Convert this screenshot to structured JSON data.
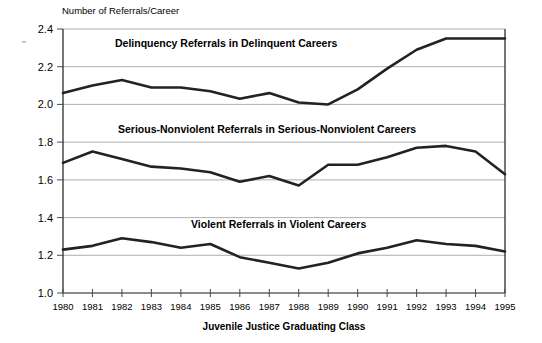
{
  "chart_data": {
    "type": "line",
    "title": "",
    "xlabel": "Juvenile Justice Graduating Class",
    "ylabel": "Number of Referrals/Career",
    "categories": [
      "1980",
      "1981",
      "1982",
      "1983",
      "1984",
      "1985",
      "1986",
      "1987",
      "1988",
      "1989",
      "1990",
      "1991",
      "1992",
      "1993",
      "1994",
      "1995"
    ],
    "x": [
      1980,
      1981,
      1982,
      1983,
      1984,
      1985,
      1986,
      1987,
      1988,
      1989,
      1990,
      1991,
      1992,
      1993,
      1994,
      1995
    ],
    "ylim": [
      1.0,
      2.4
    ],
    "yticks": [
      "1.0",
      "1.2",
      "1.4",
      "1.6",
      "1.8",
      "2.0",
      "2.2",
      "2.4"
    ],
    "ytick_values": [
      1.0,
      1.2,
      1.4,
      1.6,
      1.8,
      2.0,
      2.2,
      2.4
    ],
    "grid": true,
    "legend_position": "inline-labels",
    "series": [
      {
        "name": "Delinquency Referrals in Delinquent Careers",
        "label": "Delinquency Referrals in Delinquent Careers",
        "values": [
          2.06,
          2.1,
          2.13,
          2.09,
          2.09,
          2.07,
          2.03,
          2.06,
          2.01,
          2.0,
          2.08,
          2.19,
          2.29,
          2.35,
          2.35,
          2.35
        ]
      },
      {
        "name": "Serious-Nonviolent Referrals in Serious-Nonviolent Careers",
        "label": "Serious-Nonviolent Referrals in Serious-Nonviolent Careers",
        "values": [
          1.69,
          1.75,
          1.71,
          1.67,
          1.66,
          1.64,
          1.59,
          1.62,
          1.57,
          1.68,
          1.68,
          1.72,
          1.77,
          1.78,
          1.75,
          1.63
        ]
      },
      {
        "name": "Violent Referrals in Violent Careers",
        "label": "Violent Referrals in Violent Careers",
        "values": [
          1.23,
          1.25,
          1.29,
          1.27,
          1.24,
          1.26,
          1.19,
          1.16,
          1.13,
          1.16,
          1.21,
          1.24,
          1.28,
          1.26,
          1.25,
          1.22
        ]
      }
    ],
    "series_label_notes": {
      "serious_nonviolent_clipped": true
    }
  },
  "axes": {
    "y_title": "Number of Referrals/Career",
    "x_title": "Juvenile Justice Graduating Class"
  },
  "ticks": {
    "y": [
      "2.4",
      "2.2",
      "2.0",
      "1.8",
      "1.6",
      "1.4",
      "1.2",
      "1.0"
    ],
    "x": [
      "1980",
      "1981",
      "1982",
      "1983",
      "1984",
      "1985",
      "1986",
      "1987",
      "1988",
      "1989",
      "1990",
      "1991",
      "1992",
      "1993",
      "1994",
      "1995"
    ]
  },
  "labels": {
    "delinquency": "Delinquency Referrals in Delinquent Careers",
    "serious_nonviolent": "Serious-Nonviolent Referrals in Serious-Nonviolent Careers",
    "violent": "Violent Referrals in Violent Careers"
  },
  "colors": {
    "line": "#222222",
    "grid": "#9a9a9a",
    "axis": "#1a1a1a",
    "background": "#ffffff",
    "text": "#000000"
  }
}
